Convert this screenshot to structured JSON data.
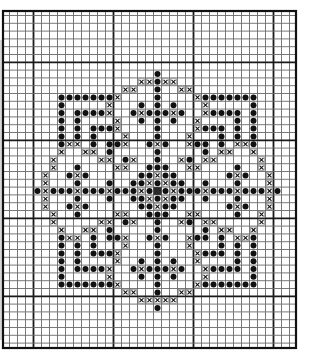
{
  "chart_data": {
    "type": "cross-stitch-pattern",
    "title": "",
    "grid": {
      "columns": 37,
      "rows": 43,
      "major_every": 10,
      "cell_width": 8,
      "cell_height": 7.8,
      "center_col": 19,
      "center_row": 16
    },
    "legend": [
      {
        "symbol": "dot",
        "description": "filled circle stitch"
      },
      {
        "symbol": "cross",
        "description": "boxed x stitch"
      },
      {
        "symbol": "fill",
        "description": "solid filled center cell"
      }
    ],
    "symmetry": "four-fold mirror about center column and center row",
    "quadrant_top_left": [
      {
        "r": 1,
        "dot": [
          19
        ],
        "cross": []
      },
      {
        "r": 2,
        "dot": [
          19
        ],
        "cross": [
          17,
          18
        ]
      },
      {
        "r": 3,
        "dot": [
          19
        ],
        "cross": [
          15,
          16
        ]
      },
      {
        "r": 4,
        "dot": [
          7,
          8,
          9,
          10,
          11,
          12,
          13,
          19
        ],
        "cross": [
          14
        ]
      },
      {
        "r": 5,
        "dot": [
          7,
          17,
          19
        ],
        "cross": [
          13
        ]
      },
      {
        "r": 6,
        "dot": [
          7,
          9,
          10,
          11,
          12,
          16,
          18,
          19
        ],
        "cross": [
          13,
          17
        ]
      },
      {
        "r": 7,
        "dot": [
          7,
          9,
          17,
          19
        ],
        "cross": [
          14
        ]
      },
      {
        "r": 8,
        "dot": [
          7,
          9,
          11,
          12,
          13,
          19
        ],
        "cross": [
          14
        ]
      },
      {
        "r": 9,
        "dot": [
          7,
          9,
          11,
          19
        ],
        "cross": [
          15
        ]
      },
      {
        "r": 10,
        "dot": [
          7,
          11,
          13,
          14,
          18
        ],
        "cross": [
          8,
          9,
          15,
          19
        ]
      },
      {
        "r": 11,
        "dot": [
          13,
          19
        ],
        "cross": [
          7,
          10,
          11
        ]
      },
      {
        "r": 12,
        "dot": [
          15,
          19
        ],
        "cross": [
          6,
          12,
          13,
          16
        ]
      },
      {
        "r": 13,
        "dot": [
          9,
          18,
          19
        ],
        "cross": [
          6,
          14,
          15
        ]
      },
      {
        "r": 14,
        "dot": [
          8,
          10,
          17,
          18
        ],
        "cross": [
          5,
          9,
          19
        ]
      },
      {
        "r": 15,
        "dot": [
          9,
          13,
          16,
          17,
          19
        ],
        "cross": [
          5,
          18
        ]
      },
      {
        "r": 16,
        "dot": [
          4,
          6,
          7,
          8,
          10,
          11,
          12,
          14,
          15,
          16,
          18
        ],
        "cross": [
          5,
          9,
          13,
          17
        ],
        "fill": [
          19
        ]
      }
    ],
    "overrides": [
      {
        "r": 30,
        "dot": [],
        "cross": [
          17,
          18,
          19,
          20,
          21
        ]
      }
    ]
  },
  "colors": {
    "ink": "#111111",
    "grid_minor": "#6a6a6a",
    "grid_major": "#1a1a1a",
    "background": "#ffffff",
    "shadow": "#cfcfcf"
  }
}
